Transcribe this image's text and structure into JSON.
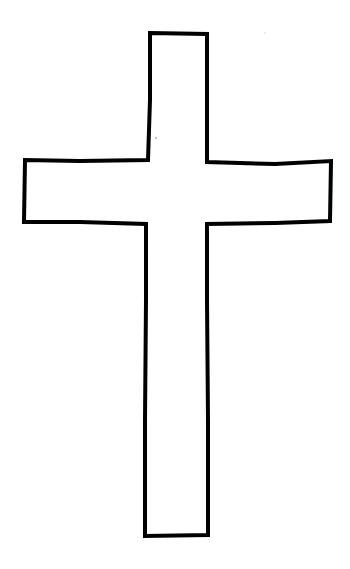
{
  "drawing": {
    "subject": "cross outline",
    "stroke_color": "#000000",
    "background_color": "#ffffff"
  }
}
